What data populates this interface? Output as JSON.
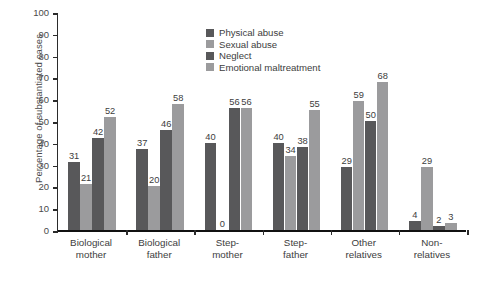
{
  "chart_data": {
    "type": "bar",
    "title": "",
    "xlabel": "",
    "ylabel": "Percentage of substantiated cases",
    "ylim": [
      0,
      100
    ],
    "ytick_step": 10,
    "yticks": [
      100,
      90,
      80,
      70,
      60,
      50,
      40,
      30,
      20,
      10,
      0
    ],
    "grid": false,
    "legend_position": "top-center",
    "categories": [
      "Biological\nmother",
      "Biological\nfather",
      "Step-\nmother",
      "Step-\nfather",
      "Other\nrelatives",
      "Non-\nrelatives"
    ],
    "categories_lines": [
      [
        "Biological",
        "mother"
      ],
      [
        "Biological",
        "father"
      ],
      [
        "Step-",
        "mother"
      ],
      [
        "Step-",
        "father"
      ],
      [
        "Other",
        "relatives"
      ],
      [
        "Non-",
        "relatives"
      ]
    ],
    "series": [
      {
        "name": "Physical abuse",
        "color": "#58585a",
        "values": [
          31,
          37,
          40,
          40,
          29,
          4
        ]
      },
      {
        "name": "Sexual abuse",
        "color": "#9b9b9d",
        "values": [
          21,
          20,
          0,
          34,
          59,
          29
        ]
      },
      {
        "name": "Neglect",
        "color": "#58585a",
        "values": [
          42,
          46,
          56,
          38,
          50,
          2
        ]
      },
      {
        "name": "Emotional maltreatment",
        "color": "#9b9b9d",
        "values": [
          52,
          58,
          56,
          55,
          68,
          3
        ]
      }
    ]
  },
  "colors": {
    "dark_bar": "#58585a",
    "light_bar": "#9b9b9d",
    "axis": "#2b2b2b",
    "text": "#3d3d3d",
    "background": "#ffffff"
  }
}
